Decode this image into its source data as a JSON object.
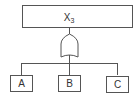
{
  "diagram": {
    "type": "fault-tree",
    "top_event": {
      "label": "X",
      "subscript": "3"
    },
    "gate": {
      "type": "OR"
    },
    "basic_events": [
      {
        "label": "A"
      },
      {
        "label": "B"
      },
      {
        "label": "C"
      }
    ],
    "colors": {
      "stroke": "#555555",
      "text": "#333333",
      "background": "#ffffff"
    }
  }
}
